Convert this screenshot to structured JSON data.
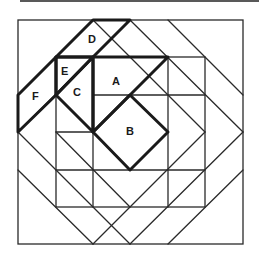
{
  "diagram": {
    "type": "quilt-block-pattern",
    "pieces": [
      {
        "id": "A",
        "label": "A",
        "x": 117,
        "y": 85
      },
      {
        "id": "B",
        "label": "B",
        "x": 131,
        "y": 134
      },
      {
        "id": "C",
        "label": "C",
        "x": 78,
        "y": 95
      },
      {
        "id": "D",
        "label": "D",
        "x": 93,
        "y": 42
      },
      {
        "id": "E",
        "label": "E",
        "x": 66,
        "y": 74
      },
      {
        "id": "F",
        "label": "F",
        "x": 36,
        "y": 99
      }
    ]
  }
}
